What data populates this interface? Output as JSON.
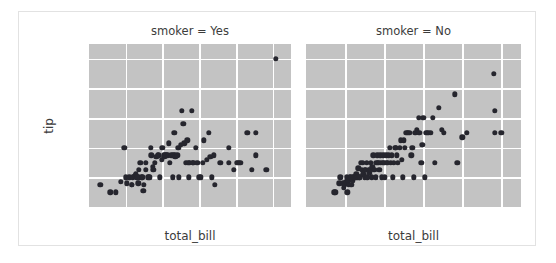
{
  "figure": {
    "ylabel": "tip",
    "xlabel": "total_bill",
    "caption": ""
  },
  "chart_data": {
    "type": "scatter",
    "title": "",
    "xlabel": "total_bill",
    "ylabel": "tip",
    "xlim": [
      0,
      55
    ],
    "ylim": [
      0,
      11
    ],
    "xticks": [
      10,
      20,
      30,
      40,
      50
    ],
    "yticks": [
      2,
      4,
      6,
      8,
      10
    ],
    "grid": true,
    "legend": false,
    "facet_variable": "smoker",
    "facets": [
      {
        "label": "smoker = Yes",
        "points": [
          [
            3.1,
            1.5
          ],
          [
            5.8,
            1.0
          ],
          [
            7.3,
            1.0
          ],
          [
            8.6,
            1.7
          ],
          [
            9.6,
            4.0
          ],
          [
            10.1,
            2.0
          ],
          [
            10.3,
            1.6
          ],
          [
            11.0,
            2.0
          ],
          [
            11.6,
            1.5
          ],
          [
            11.7,
            1.5
          ],
          [
            12.0,
            2.0
          ],
          [
            12.4,
            2.1
          ],
          [
            12.5,
            2.1
          ],
          [
            12.8,
            2.2
          ],
          [
            13.0,
            2.0
          ],
          [
            13.2,
            2.0
          ],
          [
            13.4,
            1.6
          ],
          [
            13.4,
            2.0
          ],
          [
            13.5,
            2.5
          ],
          [
            14.0,
            3.0
          ],
          [
            14.3,
            2.0
          ],
          [
            14.5,
            2.0
          ],
          [
            14.8,
            1.1
          ],
          [
            15.0,
            1.5
          ],
          [
            15.4,
            2.5
          ],
          [
            15.5,
            3.0
          ],
          [
            16.0,
            2.0
          ],
          [
            16.3,
            2.0
          ],
          [
            16.5,
            2.0
          ],
          [
            16.8,
            4.0
          ],
          [
            17.0,
            3.5
          ],
          [
            17.3,
            2.7
          ],
          [
            17.5,
            2.5
          ],
          [
            18.0,
            3.0
          ],
          [
            18.3,
            3.4
          ],
          [
            18.7,
            3.5
          ],
          [
            19.0,
            3.5
          ],
          [
            19.2,
            2.0
          ],
          [
            19.8,
            3.2
          ],
          [
            20.0,
            4.0
          ],
          [
            20.3,
            3.5
          ],
          [
            20.5,
            3.4
          ],
          [
            20.8,
            3.5
          ],
          [
            21.0,
            3.5
          ],
          [
            21.5,
            3.5
          ],
          [
            21.7,
            4.3
          ],
          [
            22.0,
            3.0
          ],
          [
            22.4,
            3.5
          ],
          [
            22.8,
            2.0
          ],
          [
            23.0,
            3.5
          ],
          [
            23.2,
            5.0
          ],
          [
            23.3,
            3.5
          ],
          [
            23.5,
            3.4
          ],
          [
            24.0,
            3.5
          ],
          [
            24.3,
            4.0
          ],
          [
            24.5,
            2.0
          ],
          [
            25.0,
            4.2
          ],
          [
            25.3,
            6.5
          ],
          [
            25.7,
            5.6
          ],
          [
            26.0,
            4.3
          ],
          [
            26.4,
            3.0
          ],
          [
            26.8,
            4.5
          ],
          [
            27.0,
            3.0
          ],
          [
            27.2,
            2.0
          ],
          [
            27.5,
            3.0
          ],
          [
            28.0,
            6.5
          ],
          [
            28.2,
            3.0
          ],
          [
            28.4,
            3.0
          ],
          [
            29.0,
            4.0
          ],
          [
            29.5,
            3.0
          ],
          [
            30.0,
            2.0
          ],
          [
            30.4,
            2.0
          ],
          [
            31.0,
            3.0
          ],
          [
            31.3,
            4.5
          ],
          [
            32.0,
            3.2
          ],
          [
            32.7,
            5.0
          ],
          [
            33.0,
            3.4
          ],
          [
            33.5,
            2.0
          ],
          [
            34.0,
            3.5
          ],
          [
            34.3,
            1.5
          ],
          [
            35.8,
            3.0
          ],
          [
            38.0,
            3.0
          ],
          [
            38.1,
            4.0
          ],
          [
            39.4,
            2.5
          ],
          [
            40.2,
            3.0
          ],
          [
            40.6,
            3.0
          ],
          [
            41.2,
            3.0
          ],
          [
            43.1,
            5.0
          ],
          [
            44.3,
            2.5
          ],
          [
            45.4,
            3.5
          ],
          [
            45.4,
            5.0
          ],
          [
            48.3,
            2.5
          ],
          [
            50.8,
            10.0
          ]
        ]
      },
      {
        "label": "smoker = No",
        "points": [
          [
            7.2,
            1.0
          ],
          [
            7.5,
            1.0
          ],
          [
            8.5,
            1.6
          ],
          [
            8.8,
            2.0
          ],
          [
            9.5,
            1.6
          ],
          [
            9.6,
            1.3
          ],
          [
            10.0,
            1.5
          ],
          [
            10.3,
            1.7
          ],
          [
            10.5,
            2.0
          ],
          [
            10.6,
            1.0
          ],
          [
            10.8,
            1.8
          ],
          [
            11.0,
            1.5
          ],
          [
            11.2,
            2.0
          ],
          [
            11.4,
            2.0
          ],
          [
            11.6,
            1.5
          ],
          [
            11.9,
            1.8
          ],
          [
            12.0,
            2.0
          ],
          [
            12.2,
            2.0
          ],
          [
            12.5,
            2.0
          ],
          [
            12.7,
            2.0
          ],
          [
            12.9,
            2.2
          ],
          [
            13.0,
            2.0
          ],
          [
            13.2,
            2.0
          ],
          [
            13.4,
            2.6
          ],
          [
            13.6,
            2.0
          ],
          [
            13.8,
            2.0
          ],
          [
            14.0,
            3.0
          ],
          [
            14.2,
            2.5
          ],
          [
            14.5,
            3.0
          ],
          [
            14.7,
            2.2
          ],
          [
            15.0,
            2.0
          ],
          [
            15.1,
            2.5
          ],
          [
            15.3,
            2.5
          ],
          [
            15.5,
            3.0
          ],
          [
            15.7,
            2.0
          ],
          [
            16.0,
            2.5
          ],
          [
            16.2,
            2.3
          ],
          [
            16.4,
            2.5
          ],
          [
            16.6,
            3.0
          ],
          [
            16.8,
            2.0
          ],
          [
            17.0,
            2.7
          ],
          [
            17.2,
            3.5
          ],
          [
            17.4,
            2.5
          ],
          [
            17.6,
            2.5
          ],
          [
            17.8,
            2.0
          ],
          [
            18.0,
            3.0
          ],
          [
            18.2,
            3.5
          ],
          [
            18.4,
            3.0
          ],
          [
            18.6,
            3.0
          ],
          [
            18.8,
            2.5
          ],
          [
            19.0,
            3.5
          ],
          [
            19.2,
            3.0
          ],
          [
            19.4,
            2.0
          ],
          [
            19.6,
            3.0
          ],
          [
            19.8,
            3.5
          ],
          [
            20.0,
            3.0
          ],
          [
            20.2,
            2.0
          ],
          [
            20.5,
            3.5
          ],
          [
            20.7,
            3.0
          ],
          [
            21.0,
            3.0
          ],
          [
            21.2,
            3.5
          ],
          [
            21.5,
            4.0
          ],
          [
            21.7,
            3.0
          ],
          [
            22.0,
            3.5
          ],
          [
            22.2,
            2.0
          ],
          [
            22.5,
            3.0
          ],
          [
            22.8,
            4.0
          ],
          [
            23.0,
            4.0
          ],
          [
            23.3,
            3.5
          ],
          [
            23.5,
            3.0
          ],
          [
            24.0,
            4.0
          ],
          [
            24.3,
            4.5
          ],
          [
            24.5,
            3.2
          ],
          [
            24.7,
            2.0
          ],
          [
            25.0,
            4.5
          ],
          [
            25.3,
            4.0
          ],
          [
            25.7,
            5.0
          ],
          [
            26.0,
            5.0
          ],
          [
            26.4,
            5.0
          ],
          [
            26.9,
            3.5
          ],
          [
            27.2,
            4.0
          ],
          [
            27.5,
            2.0
          ],
          [
            28.0,
            5.0
          ],
          [
            28.4,
            5.2
          ],
          [
            28.9,
            6.0
          ],
          [
            29.0,
            5.0
          ],
          [
            29.5,
            3.0
          ],
          [
            29.8,
            4.2
          ],
          [
            30.0,
            6.0
          ],
          [
            30.4,
            2.0
          ],
          [
            30.8,
            5.0
          ],
          [
            31.3,
            5.0
          ],
          [
            32.0,
            5.0
          ],
          [
            32.4,
            6.0
          ],
          [
            32.9,
            3.0
          ],
          [
            34.0,
            6.7
          ],
          [
            34.8,
            5.2
          ],
          [
            35.3,
            5.0
          ],
          [
            38.0,
            7.6
          ],
          [
            38.7,
            3.0
          ],
          [
            40.0,
            4.7
          ],
          [
            41.2,
            5.0
          ],
          [
            48.0,
            9.0
          ],
          [
            48.3,
            6.5
          ],
          [
            48.3,
            5.0
          ],
          [
            50.0,
            5.0
          ]
        ]
      }
    ]
  }
}
